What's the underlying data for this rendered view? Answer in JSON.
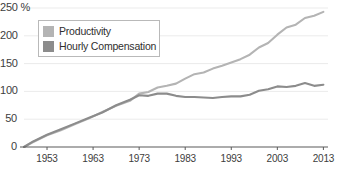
{
  "chart_data": {
    "type": "line",
    "title": "",
    "subtitle": "",
    "xlabel": "",
    "ylabel": "",
    "yunit": "%",
    "xlim": [
      1948,
      2014
    ],
    "ylim": [
      0,
      250
    ],
    "grid": true,
    "legend_position": "top-left",
    "yticks": [
      0,
      50,
      100,
      150,
      200,
      250
    ],
    "ytick_labels": [
      "0",
      "50",
      "100",
      "150",
      "200",
      "250 %"
    ],
    "xticks": [
      1953,
      1963,
      1973,
      1983,
      1993,
      2003,
      2013
    ],
    "xtick_labels": [
      "1953",
      "1963",
      "1973",
      "1983",
      "1993",
      "2003",
      "2013"
    ],
    "series": [
      {
        "name": "Productivity",
        "color": "#b4b4b4",
        "x": [
          1948,
          1950,
          1953,
          1956,
          1959,
          1962,
          1965,
          1968,
          1971,
          1973,
          1975,
          1977,
          1979,
          1981,
          1983,
          1985,
          1987,
          1989,
          1991,
          1993,
          1995,
          1997,
          1999,
          2001,
          2003,
          2005,
          2007,
          2009,
          2011,
          2013
        ],
        "values": [
          0,
          9,
          21,
          30,
          41,
          51,
          63,
          74,
          83,
          96,
          99,
          107,
          110,
          114,
          123,
          131,
          134,
          141,
          146,
          152,
          158,
          166,
          179,
          187,
          202,
          215,
          220,
          232,
          236,
          243
        ]
      },
      {
        "name": "Hourly Compensation",
        "color": "#8c8c8c",
        "x": [
          1948,
          1950,
          1953,
          1956,
          1959,
          1962,
          1965,
          1968,
          1971,
          1973,
          1975,
          1977,
          1979,
          1981,
          1983,
          1985,
          1987,
          1989,
          1991,
          1993,
          1995,
          1997,
          1999,
          2001,
          2003,
          2005,
          2007,
          2009,
          2011,
          2013
        ],
        "values": [
          0,
          10,
          22,
          32,
          42,
          52,
          62,
          75,
          85,
          93,
          92,
          96,
          96,
          92,
          90,
          90,
          89,
          88,
          90,
          91,
          91,
          94,
          101,
          104,
          109,
          108,
          110,
          115,
          110,
          112
        ]
      }
    ],
    "annotation": "Productivity and hourly compensation track together until the early 1970s, after which productivity grows far faster than compensation."
  },
  "axis": {
    "axis_line_color": "#5a5a5a",
    "grid_color": "#ebebeb",
    "tick_text_color": "#3d3d3d"
  },
  "legend": {
    "items": [
      {
        "label": "Productivity",
        "color": "#b4b4b4"
      },
      {
        "label": "Hourly Compensation",
        "color": "#8c8c8c"
      }
    ]
  }
}
